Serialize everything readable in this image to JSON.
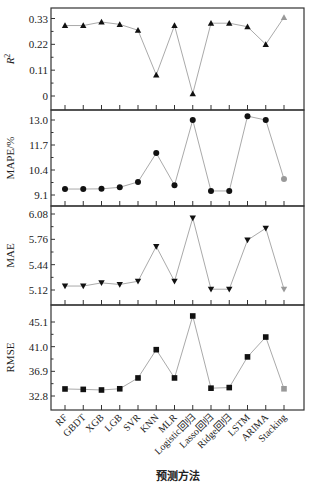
{
  "chart_data": {
    "type": "line",
    "layout": "4 vertically stacked panels sharing x-axis",
    "xlabel": "预测方法",
    "categories": [
      "RF",
      "GBDT",
      "XGB",
      "LGB",
      "SVR",
      "KNN",
      "MLR",
      "Logistic回归",
      "Lasso回归",
      "Ridge回归",
      "LSTM",
      "ARIMA",
      "Stacking"
    ],
    "grid": false,
    "legend": null,
    "colors": {
      "marker": "#111111",
      "highlight_marker": "#999999",
      "line": "#aaaaaa",
      "frame": "#333333"
    },
    "panels": [
      {
        "ylabel": "R²",
        "marker": "triangle-up",
        "yticks": [
          0,
          0.11,
          0.22,
          0.33
        ],
        "ytick_labels": [
          "0",
          "0.11",
          "0.22",
          "0.33"
        ],
        "ylim": [
          -0.035,
          0.355
        ],
        "values": [
          0.3,
          0.3,
          0.315,
          0.305,
          0.28,
          0.09,
          0.3,
          0.01,
          0.31,
          0.31,
          0.295,
          0.22,
          0.335
        ]
      },
      {
        "ylabel": "MAPE/%",
        "marker": "circle",
        "yticks": [
          9.1,
          10.4,
          11.7,
          13.0
        ],
        "ytick_labels": [
          "9.1",
          "10.4",
          "11.7",
          "13.0"
        ],
        "ylim": [
          8.55,
          13.45
        ],
        "values": [
          9.41,
          9.41,
          9.42,
          9.5,
          9.78,
          11.28,
          9.61,
          13.0,
          9.31,
          9.31,
          13.2,
          13.0,
          9.93
        ]
      },
      {
        "ylabel": "MAE",
        "marker": "triangle-down",
        "yticks": [
          5.12,
          5.44,
          5.76,
          6.08
        ],
        "ytick_labels": [
          "5.12",
          "5.44",
          "5.76",
          "6.08"
        ],
        "ylim": [
          4.93,
          6.14
        ],
        "values": [
          5.17,
          5.17,
          5.21,
          5.19,
          5.23,
          5.67,
          5.23,
          6.03,
          5.13,
          5.13,
          5.75,
          5.9,
          5.13
        ]
      },
      {
        "ylabel": "RMSE",
        "marker": "square",
        "yticks": [
          32.8,
          36.9,
          41.0,
          45.1
        ],
        "ytick_labels": [
          "32.8",
          "36.9",
          "41.0",
          "45.1"
        ],
        "ylim": [
          30.4,
          46.9
        ],
        "values": [
          33.97,
          33.9,
          33.8,
          34.0,
          35.8,
          40.5,
          35.8,
          46.1,
          34.1,
          34.2,
          39.3,
          42.6,
          34.0
        ]
      }
    ]
  }
}
